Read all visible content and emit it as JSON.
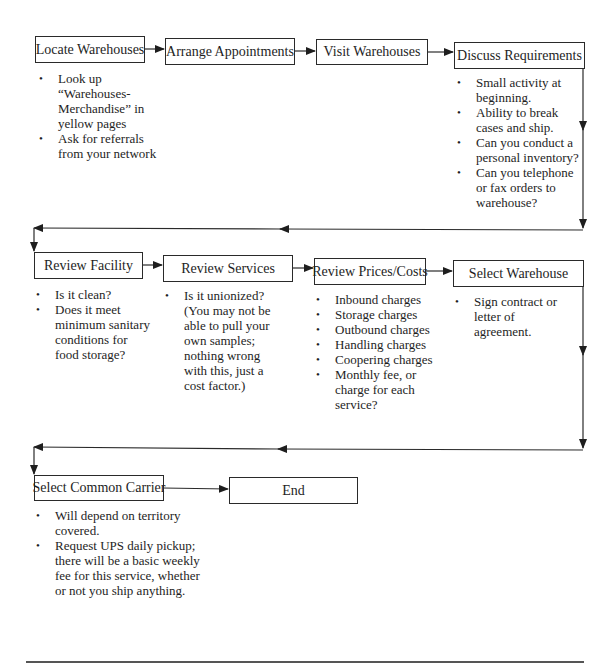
{
  "diagram": {
    "type": "flowchart",
    "rows": [
      {
        "steps": [
          {
            "id": "locate",
            "label": "Locate Warehouses",
            "notes": [
              "Look up “Warehouses-Merchandise” in yellow pages",
              "Ask for referrals from your network"
            ]
          },
          {
            "id": "arrange",
            "label": "Arrange Appointments",
            "notes": []
          },
          {
            "id": "visit",
            "label": "Visit Warehouses",
            "notes": []
          },
          {
            "id": "discuss",
            "label": "Discuss Requirements",
            "notes": [
              "Small activity at beginning.",
              "Ability to break cases and ship.",
              "Can you conduct a personal inventory?",
              "Can you telephone or fax orders to warehouse?"
            ]
          }
        ]
      },
      {
        "steps": [
          {
            "id": "facility",
            "label": "Review Facility",
            "notes": [
              "Is it clean?",
              "Does it meet minimum sanitary conditions for food storage?"
            ]
          },
          {
            "id": "services",
            "label": "Review Services",
            "notes": [
              "Is it unionized? (You may not be able to pull your own samples; nothing wrong with this, just a cost factor.)"
            ]
          },
          {
            "id": "prices",
            "label": "Review Prices/Costs",
            "notes": [
              "Inbound charges",
              "Storage charges",
              "Outbound charges",
              "Handling charges",
              "Coopering charges",
              "Monthly fee, or charge for each service?"
            ]
          },
          {
            "id": "select_wh",
            "label": "Select Warehouse",
            "notes": [
              "Sign contract or letter of agreement."
            ]
          }
        ]
      },
      {
        "steps": [
          {
            "id": "carrier",
            "label": "Select Common Carrier",
            "notes": [
              "Will depend on territory covered.",
              "Request UPS daily pickup; there will be a basic weekly fee for this service, whether or not you ship anything."
            ]
          },
          {
            "id": "end",
            "label": "End",
            "notes": []
          }
        ]
      }
    ],
    "edges": [
      [
        "locate",
        "arrange"
      ],
      [
        "arrange",
        "visit"
      ],
      [
        "visit",
        "discuss"
      ],
      [
        "discuss",
        "facility"
      ],
      [
        "facility",
        "services"
      ],
      [
        "services",
        "prices"
      ],
      [
        "prices",
        "select_wh"
      ],
      [
        "select_wh",
        "carrier"
      ],
      [
        "carrier",
        "end"
      ]
    ]
  }
}
